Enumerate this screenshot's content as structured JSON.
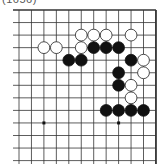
{
  "caption": "(1656)",
  "board": {
    "grid": {
      "x0": 19,
      "dx": 12.45,
      "cols": 12,
      "y0": 10,
      "dy": 12.55,
      "rows": 13,
      "left_extent": 13,
      "bottom_extent": 164,
      "top_edge": true,
      "right_edge": true
    },
    "colors": {
      "line": "#333333",
      "black": "#111111",
      "white": "#ffffff",
      "white_outline": "#222222"
    },
    "star_points": [
      [
        2,
        9
      ],
      [
        8,
        9
      ]
    ],
    "stones": [
      {
        "color": "white",
        "col": 5,
        "row": 2
      },
      {
        "color": "white",
        "col": 6,
        "row": 2
      },
      {
        "color": "white",
        "col": 7,
        "row": 2
      },
      {
        "color": "white",
        "col": 9,
        "row": 2
      },
      {
        "color": "white",
        "col": 2,
        "row": 3
      },
      {
        "color": "white",
        "col": 3,
        "row": 3
      },
      {
        "color": "white",
        "col": 5,
        "row": 3
      },
      {
        "color": "black",
        "col": 6,
        "row": 3
      },
      {
        "color": "black",
        "col": 7,
        "row": 3
      },
      {
        "color": "black",
        "col": 8,
        "row": 3
      },
      {
        "color": "black",
        "col": 4,
        "row": 4
      },
      {
        "color": "black",
        "col": 5,
        "row": 4
      },
      {
        "color": "black",
        "col": 9,
        "row": 4
      },
      {
        "color": "white",
        "col": 10,
        "row": 4
      },
      {
        "color": "black",
        "col": 8,
        "row": 5
      },
      {
        "color": "white",
        "col": 10,
        "row": 5
      },
      {
        "color": "black",
        "col": 8,
        "row": 6
      },
      {
        "color": "white",
        "col": 9,
        "row": 6
      },
      {
        "color": "white",
        "col": 9,
        "row": 7
      },
      {
        "color": "black",
        "col": 7,
        "row": 8
      },
      {
        "color": "black",
        "col": 8,
        "row": 8
      },
      {
        "color": "black",
        "col": 9,
        "row": 8
      },
      {
        "color": "black",
        "col": 10,
        "row": 8
      }
    ]
  }
}
